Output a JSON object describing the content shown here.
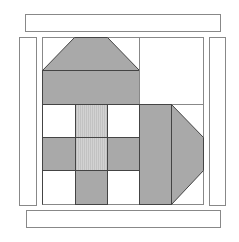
{
  "diagram": {
    "title": "",
    "colors": {
      "background": "#ffffff",
      "outline": "#555555",
      "dark_fabric": "#a9a9a9",
      "light_fabric": "#cdcdcd",
      "white_fabric": "#ffffff",
      "border_strip_outline": "#888888"
    },
    "border_strips": [
      {
        "name": "top",
        "x": 25,
        "y": 14,
        "w": 195,
        "h": 17
      },
      {
        "name": "bottom",
        "x": 26,
        "y": 210,
        "w": 194,
        "h": 17
      },
      {
        "name": "left",
        "x": 19,
        "y": 37,
        "w": 17,
        "h": 168
      },
      {
        "name": "right",
        "x": 209,
        "y": 37,
        "w": 16,
        "h": 168
      }
    ],
    "block": {
      "x": 42,
      "y": 37,
      "w": 161,
      "h": 167
    }
  }
}
